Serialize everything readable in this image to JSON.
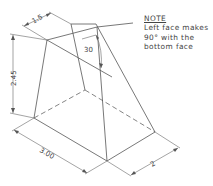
{
  "note": {
    "heading": "NOTE",
    "lines": [
      "Left face makes",
      "90° with the",
      "bottom face"
    ]
  },
  "dimensions": {
    "top_depth": "1.5",
    "height": "2.45",
    "angle": "30",
    "base_width": "3.00",
    "base_depth": "2"
  },
  "colors": {
    "line": "#555555",
    "background": "#ffffff"
  }
}
